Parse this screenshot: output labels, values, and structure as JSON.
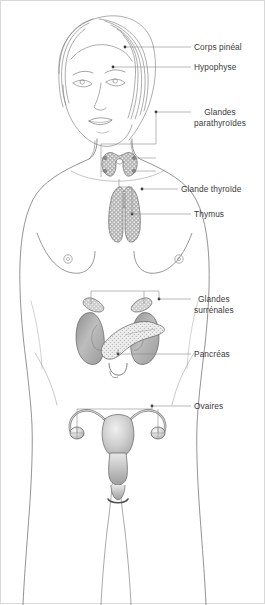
{
  "figure": {
    "background_color": "#ffffff",
    "line_color": "#555555",
    "label_color": "#3a3a3a",
    "leader_color": "#6a6a6a"
  },
  "labels": [
    {
      "id": "corps-pineal",
      "text": "Corps pinéal",
      "lines": [
        "Corps pinéal"
      ],
      "x": 193,
      "y": 41,
      "leader_y": 46,
      "leader_x1": 124,
      "leader_x2": 190,
      "dot_x": 124,
      "dot_y": 46
    },
    {
      "id": "hypophyse",
      "text": "Hypophyse",
      "lines": [
        "Hypophyse"
      ],
      "x": 193,
      "y": 61,
      "leader_y": 66,
      "leader_x1": 112,
      "leader_x2": 190,
      "dot_x": 112,
      "dot_y": 66
    },
    {
      "id": "glandes-parathyroides",
      "text": "Glandes parathyroïdes",
      "lines": [
        "Glandes",
        "parathyroïdes"
      ],
      "x": 193,
      "y": 106,
      "leader_y": 111,
      "leader_x1": 155,
      "leader_x2": 190,
      "dot_x": 155,
      "dot_y": 111
    },
    {
      "id": "glande-thyroide",
      "text": "Glande thyroïde",
      "lines": [
        "Glande thyroïde"
      ],
      "x": 180,
      "y": 183,
      "leader_y": 188,
      "leader_x1": 141,
      "leader_x2": 177,
      "dot_x": 141,
      "dot_y": 188
    },
    {
      "id": "thymus",
      "text": "Thymus",
      "lines": [
        "Thymus"
      ],
      "x": 193,
      "y": 208,
      "leader_y": 213,
      "leader_x1": 131,
      "leader_x2": 190,
      "dot_x": 131,
      "dot_y": 213
    },
    {
      "id": "glandes-surrenales",
      "text": "Glandes surrénales",
      "lines": [
        "Glandes",
        "surrénales"
      ],
      "x": 193,
      "y": 293,
      "leader_y": 298,
      "leader_x1": 158,
      "leader_x2": 190,
      "dot_x": 158,
      "dot_y": 298
    },
    {
      "id": "pancreas",
      "text": "Pancréas",
      "lines": [
        "Pancréas"
      ],
      "x": 193,
      "y": 348,
      "leader_y": 353,
      "leader_x1": 117,
      "leader_x2": 190,
      "dot_x": 117,
      "dot_y": 353
    },
    {
      "id": "ovaires",
      "text": "Ovaires",
      "lines": [
        "Ovaires"
      ],
      "x": 193,
      "y": 400,
      "leader_y": 405,
      "leader_x1": 151,
      "leader_x2": 190,
      "dot_x": 151,
      "dot_y": 405
    }
  ],
  "organs": [
    {
      "id": "pineal-gland",
      "name": "corps-pineal",
      "fill": "#bdbdbd"
    },
    {
      "id": "pituitary",
      "name": "hypophyse",
      "fill": "#bdbdbd"
    },
    {
      "id": "parathyroid",
      "name": "glandes-parathyroides",
      "fill": "#a9a9a9"
    },
    {
      "id": "thyroid",
      "name": "glande-thyroide",
      "fill": "#b4b4b4"
    },
    {
      "id": "thymus",
      "name": "thymus",
      "fill": "#b0b0b0"
    },
    {
      "id": "adrenal-left",
      "name": "glande-surrenale",
      "fill": "#c3c3c3"
    },
    {
      "id": "adrenal-right",
      "name": "glande-surrenale",
      "fill": "#c3c3c3"
    },
    {
      "id": "kidney-left",
      "name": "rein",
      "fill": "#9e9e9e"
    },
    {
      "id": "kidney-right",
      "name": "rein",
      "fill": "#9e9e9e"
    },
    {
      "id": "pancreas",
      "name": "pancreas",
      "fill": "#e2e2e2"
    },
    {
      "id": "uterus",
      "name": "uterus",
      "fill": "#cfcfcf"
    },
    {
      "id": "ovary-left",
      "name": "ovaire",
      "fill": "#d5d5d5"
    },
    {
      "id": "ovary-right",
      "name": "ovaire",
      "fill": "#d5d5d5"
    }
  ]
}
